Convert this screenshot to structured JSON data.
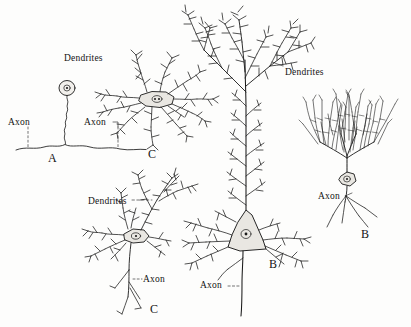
{
  "figure": {
    "background_color": "#fdfdfc",
    "ink_color": "#1a1a1a",
    "soma_fill_color": "#e9e7e2"
  },
  "labels": {
    "dendrites": "Dendrites",
    "axon": "Axon",
    "panel_a": "A",
    "panel_b": "B",
    "panel_c": "C"
  },
  "panels": [
    {
      "id": "A",
      "letter": "A",
      "name": "unipolar-neuron",
      "letter_pos": {
        "x": 48,
        "y": 152
      },
      "annotations": [
        {
          "text": "Axon",
          "name": "axon-label-a",
          "x": 8,
          "y": 118
        }
      ]
    },
    {
      "id": "C-upper",
      "letter": "C",
      "name": "multipolar-neuron-upper",
      "letter_pos": {
        "x": 148,
        "y": 148
      },
      "annotations": [
        {
          "text": "Dendrites",
          "name": "dendrites-label-upper",
          "x": 64,
          "y": 54
        },
        {
          "text": "Axon",
          "name": "axon-label-c-upper",
          "x": 84,
          "y": 118
        }
      ]
    },
    {
      "id": "C-lower",
      "letter": "C",
      "name": "multipolar-neuron-lower",
      "letter_pos": {
        "x": 150,
        "y": 308
      },
      "annotations": [
        {
          "text": "Dendrites",
          "name": "dendrites-label-lower",
          "x": 88,
          "y": 197
        },
        {
          "text": "Axon",
          "name": "axon-label-c-lower",
          "x": 143,
          "y": 280
        }
      ]
    },
    {
      "id": "B-center",
      "letter": "B",
      "name": "pyramidal-neuron-center",
      "letter_pos": {
        "x": 269,
        "y": 262
      },
      "annotations": [
        {
          "text": "Dendrites",
          "name": "dendrites-label-center",
          "x": 285,
          "y": 70
        },
        {
          "text": "Axon",
          "name": "axon-label-b-center",
          "x": 203,
          "y": 281
        }
      ]
    },
    {
      "id": "B-right",
      "letter": "B",
      "name": "purkinje-neuron-right",
      "letter_pos": {
        "x": 361,
        "y": 232
      },
      "annotations": [
        {
          "text": "Axon",
          "name": "axon-label-b-right",
          "x": 320,
          "y": 197
        }
      ]
    }
  ]
}
